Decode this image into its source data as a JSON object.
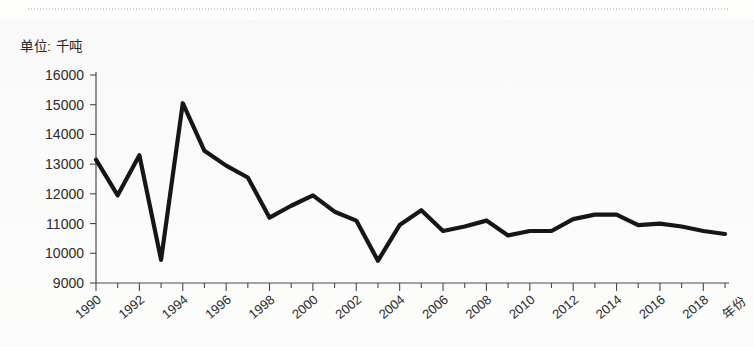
{
  "unit_label": "单位: 千吨",
  "colors": {
    "line": "#161616",
    "axis": "#4a4a4d",
    "text": "#2b2b2e",
    "background": "#fdfdfc"
  },
  "chart_data": {
    "type": "line",
    "title": "",
    "subtitle": "",
    "unit": "单位: 千吨",
    "xlabel": "年份",
    "ylabel": "",
    "grid": false,
    "legend": false,
    "ylim": [
      9000,
      16000
    ],
    "ytick_step": 1000,
    "ytick_labels": [
      "9000",
      "10000",
      "11000",
      "12000",
      "13000",
      "14000",
      "15000",
      "16000"
    ],
    "ytick_values": [
      9000,
      10000,
      11000,
      12000,
      13000,
      14000,
      15000,
      16000
    ],
    "xlim": [
      1990,
      2019
    ],
    "xtick_labels": [
      "1990",
      "1992",
      "1994",
      "1996",
      "1998",
      "2000",
      "2002",
      "2004",
      "2006",
      "2008",
      "2010",
      "2012",
      "2014",
      "2016",
      "2018"
    ],
    "xtick_values": [
      1990,
      1992,
      1994,
      1996,
      1998,
      2000,
      2002,
      2004,
      2006,
      2008,
      2010,
      2012,
      2014,
      2016,
      2018
    ],
    "x": [
      1990,
      1991,
      1992,
      1993,
      1994,
      1995,
      1996,
      1997,
      1998,
      1999,
      2000,
      2001,
      2002,
      2003,
      2004,
      2005,
      2006,
      2007,
      2008,
      2009,
      2010,
      2011,
      2012,
      2013,
      2014,
      2015,
      2016,
      2017,
      2018,
      2019
    ],
    "values": [
      13150,
      11950,
      13300,
      9780,
      15050,
      13450,
      12950,
      12550,
      11200,
      11600,
      11950,
      11400,
      11100,
      9750,
      10950,
      11450,
      10750,
      10900,
      11100,
      10600,
      10750,
      10750,
      11150,
      11300,
      11300,
      10950,
      11000,
      10900,
      10750,
      10650
    ],
    "series_name": ""
  }
}
